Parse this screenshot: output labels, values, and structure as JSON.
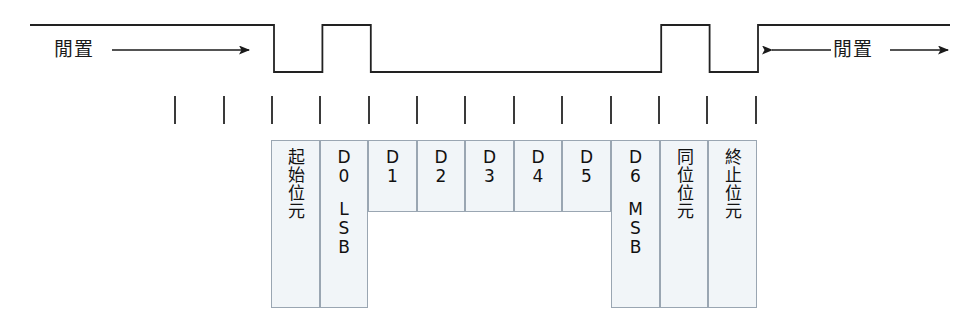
{
  "diagram": {
    "width": 978,
    "height": 330,
    "line_color": "#222222",
    "cell_fill": "#f1f5f8",
    "cell_border": "#9aa6b2"
  },
  "labels": {
    "idle_left": "閒置",
    "idle_right": "閒置"
  },
  "waveform": {
    "description": "Serial line: idle high, start bit low, 7 data bits, parity bit, stop bit, return to idle high",
    "high_y": 25,
    "low_y": 72,
    "start_x": 30,
    "end_x": 950,
    "bit_width": 48.4,
    "first_edge_x": 274,
    "levels": [
      "high",
      "low",
      "high",
      "low",
      "low",
      "low",
      "low",
      "low",
      "low",
      "high",
      "low",
      "high"
    ],
    "bit_names": [
      "idle",
      "start",
      "D0",
      "D1",
      "D2",
      "D3",
      "D4",
      "D5",
      "D6",
      "parity",
      "stop",
      "idle"
    ]
  },
  "ticks": {
    "count": 13,
    "y_top": 96,
    "y_bottom": 124,
    "positions": [
      175,
      224,
      272,
      320,
      369,
      417,
      465,
      514,
      562,
      611,
      659,
      707,
      756
    ]
  },
  "frame": {
    "top": 140,
    "tall_bottom": 308,
    "short_bottom": 212,
    "cells": [
      {
        "name": "start-bit",
        "label": "起始位元",
        "sub": "",
        "vertical": true,
        "tall": true,
        "x": 271,
        "width": 49
      },
      {
        "name": "data-bit-0",
        "label": "D\n0",
        "sub": "L\nS\nB",
        "vertical": false,
        "tall": true,
        "x": 320,
        "width": 48
      },
      {
        "name": "data-bit-1",
        "label": "D\n1",
        "sub": "",
        "vertical": false,
        "tall": false,
        "x": 368,
        "width": 49
      },
      {
        "name": "data-bit-2",
        "label": "D\n2",
        "sub": "",
        "vertical": false,
        "tall": false,
        "x": 417,
        "width": 48
      },
      {
        "name": "data-bit-3",
        "label": "D\n3",
        "sub": "",
        "vertical": false,
        "tall": false,
        "x": 465,
        "width": 49
      },
      {
        "name": "data-bit-4",
        "label": "D\n4",
        "sub": "",
        "vertical": false,
        "tall": false,
        "x": 514,
        "width": 48
      },
      {
        "name": "data-bit-5",
        "label": "D\n5",
        "sub": "",
        "vertical": false,
        "tall": false,
        "x": 562,
        "width": 49
      },
      {
        "name": "data-bit-6",
        "label": "D\n6",
        "sub": "M\nS\nB",
        "vertical": false,
        "tall": true,
        "x": 611,
        "width": 49
      },
      {
        "name": "parity-bit",
        "label": "同位位元",
        "sub": "",
        "vertical": true,
        "tall": true,
        "x": 660,
        "width": 48
      },
      {
        "name": "stop-bit",
        "label": "終止位元",
        "sub": "",
        "vertical": true,
        "tall": true,
        "x": 708,
        "width": 49
      }
    ]
  }
}
